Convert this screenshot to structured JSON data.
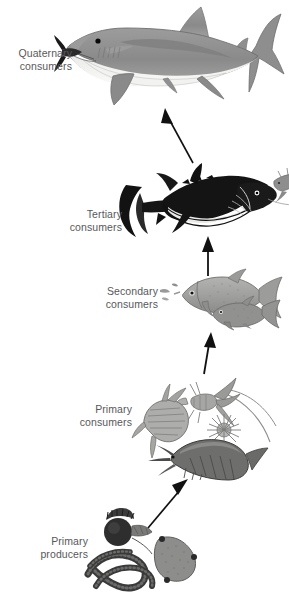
{
  "diagram": {
    "background_color": "#ffffff",
    "label_color": "#58585a"
  },
  "levels": [
    {
      "id": "quaternary",
      "label": "Quaternary\nconsumers",
      "organism": "shark",
      "organism_name": "great-white-shark",
      "label_x": 4,
      "label_y": 47,
      "label_width": 68
    },
    {
      "id": "tertiary",
      "label": "Tertiary\nconsumers",
      "organism": "tuna",
      "organism_name": "bluefin-tuna",
      "label_x": 48,
      "label_y": 208,
      "label_width": 74
    },
    {
      "id": "secondary",
      "label": "Secondary\nconsumers",
      "organism": "small-fish",
      "organism_name": "herring-fish",
      "label_x": 84,
      "label_y": 285,
      "label_width": 74
    },
    {
      "id": "primary-consumers",
      "label": "Primary\nconsumers",
      "organism": "zooplankton",
      "organism_name": "zooplankton-copepods-shrimp",
      "label_x": 58,
      "label_y": 403,
      "label_width": 74
    },
    {
      "id": "primary-producers",
      "label": "Primary\nproducers",
      "organism": "phytoplankton",
      "organism_name": "phytoplankton-diatoms",
      "label_x": 14,
      "label_y": 535,
      "label_width": 74
    }
  ],
  "arrows": [
    {
      "id": "arrow-tertiary-to-quaternary",
      "from": "tertiary",
      "to": "quaternary"
    },
    {
      "id": "arrow-secondary-to-tertiary",
      "from": "secondary",
      "to": "tertiary"
    },
    {
      "id": "arrow-primary-consumers-to-secondary",
      "from": "primary-consumers",
      "to": "secondary"
    },
    {
      "id": "arrow-producers-to-primary-consumers",
      "from": "primary-producers",
      "to": "primary-consumers"
    }
  ],
  "colors": {
    "shark_top": "#8d8d8d",
    "shark_mid": "#a8a8a8",
    "shark_belly": "#f1f1ef",
    "tuna_body": "#1b1b1b",
    "fish_body": "#9a9a98",
    "plankton": "#8e8e8c",
    "producer_dark": "#3a3a3a",
    "arrow": "#121212"
  }
}
